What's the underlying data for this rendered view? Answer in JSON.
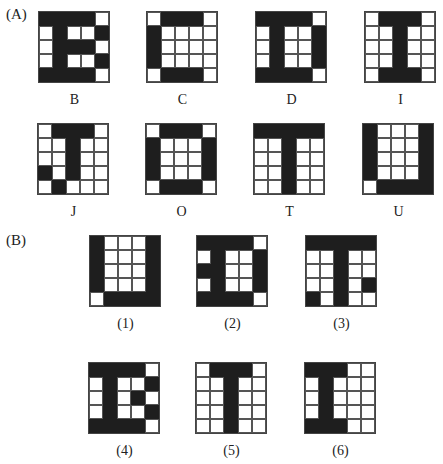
{
  "sections": {
    "A": {
      "label": "(A)"
    },
    "B": {
      "label": "(B)"
    }
  },
  "colors": {
    "filled": "#1e1e1e",
    "empty": "#ffffff",
    "grid_line": "#555555"
  },
  "partA": [
    {
      "label": "B",
      "grid": [
        [
          1,
          1,
          1,
          1,
          0
        ],
        [
          0,
          1,
          0,
          0,
          1
        ],
        [
          0,
          1,
          1,
          1,
          0
        ],
        [
          0,
          1,
          0,
          0,
          1
        ],
        [
          1,
          1,
          1,
          1,
          0
        ]
      ]
    },
    {
      "label": "C",
      "grid": [
        [
          0,
          1,
          1,
          1,
          0
        ],
        [
          1,
          0,
          0,
          0,
          0
        ],
        [
          1,
          0,
          0,
          0,
          0
        ],
        [
          1,
          0,
          0,
          0,
          0
        ],
        [
          0,
          1,
          1,
          1,
          0
        ]
      ]
    },
    {
      "label": "D",
      "grid": [
        [
          1,
          1,
          1,
          1,
          0
        ],
        [
          0,
          1,
          0,
          0,
          1
        ],
        [
          0,
          1,
          0,
          0,
          1
        ],
        [
          0,
          1,
          0,
          0,
          1
        ],
        [
          1,
          1,
          1,
          1,
          0
        ]
      ]
    },
    {
      "label": "I",
      "grid": [
        [
          0,
          1,
          1,
          1,
          0
        ],
        [
          0,
          0,
          1,
          0,
          0
        ],
        [
          0,
          0,
          1,
          0,
          0
        ],
        [
          0,
          0,
          1,
          0,
          0
        ],
        [
          0,
          1,
          1,
          1,
          0
        ]
      ]
    },
    {
      "label": "J",
      "grid": [
        [
          0,
          1,
          1,
          1,
          0
        ],
        [
          0,
          0,
          1,
          0,
          0
        ],
        [
          0,
          0,
          1,
          0,
          0
        ],
        [
          1,
          0,
          1,
          0,
          0
        ],
        [
          0,
          1,
          0,
          0,
          0
        ]
      ]
    },
    {
      "label": "O",
      "grid": [
        [
          0,
          1,
          1,
          1,
          0
        ],
        [
          1,
          0,
          0,
          0,
          1
        ],
        [
          1,
          0,
          0,
          0,
          1
        ],
        [
          1,
          0,
          0,
          0,
          1
        ],
        [
          0,
          1,
          1,
          1,
          0
        ]
      ]
    },
    {
      "label": "T",
      "grid": [
        [
          1,
          1,
          1,
          1,
          1
        ],
        [
          0,
          0,
          1,
          0,
          0
        ],
        [
          0,
          0,
          1,
          0,
          0
        ],
        [
          0,
          0,
          1,
          0,
          0
        ],
        [
          0,
          0,
          1,
          0,
          0
        ]
      ]
    },
    {
      "label": "U",
      "grid": [
        [
          1,
          0,
          0,
          0,
          1
        ],
        [
          1,
          0,
          0,
          0,
          1
        ],
        [
          1,
          0,
          0,
          0,
          1
        ],
        [
          1,
          0,
          0,
          0,
          1
        ],
        [
          0,
          1,
          1,
          1,
          1
        ]
      ]
    }
  ],
  "partB": [
    {
      "label": "(1)",
      "grid": [
        [
          1,
          0,
          0,
          0,
          1
        ],
        [
          1,
          0,
          0,
          0,
          1
        ],
        [
          1,
          0,
          0,
          0,
          1
        ],
        [
          1,
          0,
          0,
          0,
          1
        ],
        [
          0,
          1,
          1,
          1,
          1
        ]
      ]
    },
    {
      "label": "(2)",
      "grid": [
        [
          1,
          1,
          1,
          1,
          0
        ],
        [
          0,
          1,
          0,
          0,
          1
        ],
        [
          1,
          1,
          0,
          0,
          1
        ],
        [
          0,
          1,
          0,
          0,
          1
        ],
        [
          1,
          1,
          1,
          1,
          0
        ]
      ]
    },
    {
      "label": "(3)",
      "grid": [
        [
          1,
          1,
          1,
          1,
          1
        ],
        [
          0,
          0,
          1,
          0,
          0
        ],
        [
          0,
          0,
          1,
          0,
          0
        ],
        [
          0,
          0,
          1,
          0,
          1
        ],
        [
          1,
          0,
          1,
          0,
          0
        ]
      ]
    },
    {
      "label": "(4)",
      "grid": [
        [
          1,
          1,
          1,
          1,
          0
        ],
        [
          0,
          1,
          0,
          0,
          1
        ],
        [
          0,
          1,
          0,
          1,
          0
        ],
        [
          0,
          1,
          0,
          0,
          1
        ],
        [
          1,
          1,
          1,
          1,
          0
        ]
      ]
    },
    {
      "label": "(5)",
      "grid": [
        [
          0,
          1,
          1,
          1,
          0
        ],
        [
          0,
          0,
          1,
          0,
          0
        ],
        [
          0,
          0,
          1,
          0,
          0
        ],
        [
          0,
          0,
          1,
          0,
          0
        ],
        [
          0,
          0,
          1,
          0,
          0
        ]
      ]
    },
    {
      "label": "(6)",
      "grid": [
        [
          1,
          1,
          1,
          0,
          0
        ],
        [
          0,
          1,
          0,
          0,
          0
        ],
        [
          0,
          1,
          0,
          0,
          0
        ],
        [
          0,
          1,
          0,
          0,
          0
        ],
        [
          1,
          1,
          1,
          0,
          0
        ]
      ]
    }
  ]
}
